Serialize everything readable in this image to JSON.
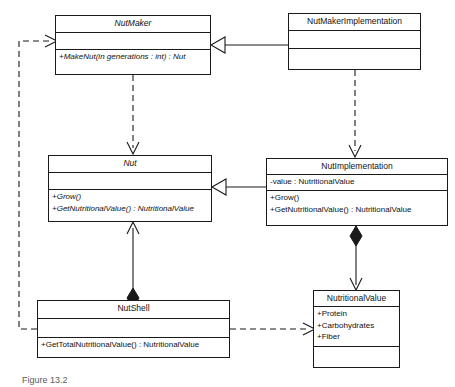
{
  "diagram": {
    "type": "uml-class-diagram",
    "caption": "Figure 13.2",
    "background_color": "#ffffff",
    "line_color": "#1a1a1a",
    "text_color": "#111111"
  },
  "classes": [
    {
      "id": "nutmaker",
      "name": "NutMaker",
      "abstract": true,
      "attributes": [],
      "methods": [
        "+MakeNut(in generations : int) : Nut"
      ],
      "methods_abstract": true,
      "x": 55,
      "y": 15,
      "width": 156,
      "height": 60
    },
    {
      "id": "nutmakerimplementation",
      "name": "NutMakerImplementation",
      "abstract": false,
      "attributes": [],
      "methods": [],
      "methods_abstract": false,
      "x": 288,
      "y": 13,
      "width": 133,
      "height": 57
    },
    {
      "id": "nut",
      "name": "Nut",
      "abstract": true,
      "attributes": [],
      "methods": [
        "+Grow()",
        "+GetNutritionalValue() : NutritionalValue"
      ],
      "methods_abstract": true,
      "x": 48,
      "y": 155,
      "width": 164,
      "height": 67
    },
    {
      "id": "nutimplementation",
      "name": "NutImplementation",
      "abstract": false,
      "attributes": [
        "-value : NutritionalValue"
      ],
      "methods": [
        "+Grow()",
        "+GetNutritionalValue() : NutritionalValue"
      ],
      "methods_abstract": false,
      "x": 266,
      "y": 158,
      "width": 182,
      "height": 68
    },
    {
      "id": "nutshell",
      "name": "NutShell",
      "abstract": false,
      "attributes": [],
      "methods": [
        "+GetTotalNutritionalValue() : NutritionalValue"
      ],
      "methods_abstract": false,
      "x": 37,
      "y": 300,
      "width": 193,
      "height": 58
    },
    {
      "id": "nutritionalvalue",
      "name": "NutritionalValue",
      "abstract": false,
      "attributes": [
        "+Protein",
        "+Carbohydrates",
        "+Fiber"
      ],
      "methods": [],
      "methods_abstract": false,
      "x": 313,
      "y": 290,
      "width": 87,
      "height": 78
    }
  ],
  "relationships": [
    {
      "id": "rel-nutmakerimpl-generalizes-nutmaker",
      "kind": "generalization",
      "style": "solid",
      "from": "nutmakerimplementation",
      "to": "nutmaker",
      "head": "hollow-triangle"
    },
    {
      "id": "rel-nutmaker-creates-nut",
      "kind": "dependency",
      "style": "dashed",
      "from": "nutmaker",
      "to": "nut",
      "head": "open-arrow"
    },
    {
      "id": "rel-nutmakerimpl-creates-nutimpl",
      "kind": "dependency",
      "style": "dashed",
      "from": "nutmakerimplementation",
      "to": "nutimplementation",
      "head": "open-arrow"
    },
    {
      "id": "rel-nutimpl-generalizes-nut",
      "kind": "generalization",
      "style": "solid",
      "from": "nutimplementation",
      "to": "nut",
      "head": "hollow-triangle"
    },
    {
      "id": "rel-nutshell-aggregates-nut",
      "kind": "composition",
      "style": "solid",
      "from": "nutshell",
      "to": "nut",
      "tail": "filled-diamond",
      "head": "open-arrow"
    },
    {
      "id": "rel-nutimpl-composes-nutritionalvalue",
      "kind": "composition",
      "style": "solid",
      "from": "nutimplementation",
      "to": "nutritionalvalue",
      "tail": "filled-diamond",
      "head": "open-arrow"
    },
    {
      "id": "rel-nutshell-depends-nutritionalvalue",
      "kind": "dependency",
      "style": "dashed",
      "from": "nutshell",
      "to": "nutritionalvalue",
      "head": "open-arrow"
    },
    {
      "id": "rel-nutshell-depends-nutmaker",
      "kind": "dependency",
      "style": "dashed",
      "from": "nutshell",
      "to": "nutmaker",
      "head": "open-arrow"
    }
  ]
}
